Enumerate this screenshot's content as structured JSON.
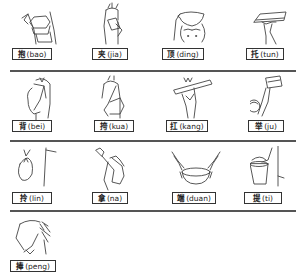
{
  "rows": [
    {
      "items": [
        {
          "hanzi": "抱",
          "pinyin": "(bao)",
          "icon": "hug-to-chest-icon"
        },
        {
          "hanzi": "夹",
          "pinyin": "(jia)",
          "icon": "hold-under-arm-icon"
        },
        {
          "hanzi": "顶",
          "pinyin": "(ding)",
          "icon": "carry-on-head-icon"
        },
        {
          "hanzi": "托",
          "pinyin": "(tun)",
          "icon": "support-on-palm-icon"
        }
      ]
    },
    {
      "items": [
        {
          "hanzi": "背",
          "pinyin": "(bei)",
          "icon": "carry-on-back-icon"
        },
        {
          "hanzi": "挎",
          "pinyin": "(kua)",
          "icon": "carry-on-arm-icon"
        },
        {
          "hanzi": "扛",
          "pinyin": "(kang)",
          "icon": "shoulder-pole-icon"
        },
        {
          "hanzi": "举",
          "pinyin": "(ju)",
          "icon": "lift-overhead-icon"
        }
      ]
    },
    {
      "items": [
        {
          "hanzi": "拎",
          "pinyin": "(lin)",
          "icon": "dangle-bag-icon"
        },
        {
          "hanzi": "拿",
          "pinyin": "(na)",
          "icon": "hold-bottle-icon"
        },
        {
          "hanzi": "端",
          "pinyin": "(duan)",
          "icon": "carry-bowl-level-icon"
        },
        {
          "hanzi": "提",
          "pinyin": "(ti)",
          "icon": "carry-bucket-icon"
        }
      ]
    },
    {
      "items": [
        {
          "hanzi": "捧",
          "pinyin": "(peng)",
          "icon": "hold-in-both-hands-icon"
        }
      ]
    }
  ]
}
